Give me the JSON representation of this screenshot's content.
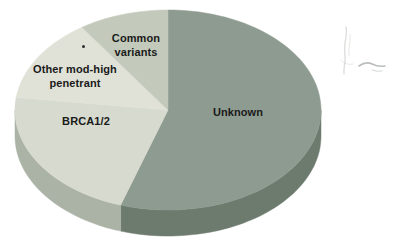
{
  "figure": {
    "background": "#ffffff",
    "label_color": "#1a1a1a"
  },
  "chart_data": {
    "type": "pie",
    "style": "3d-extruded",
    "title": "",
    "legend": "none",
    "labels_on_slices": true,
    "start_angle": "12 o'clock, clockwise",
    "slices": [
      {
        "label": "Unknown",
        "value_pct": 55,
        "color": "#8e9b90",
        "side_color": "#6d7b6f"
      },
      {
        "label": "BRCA1/2",
        "value_pct": 22,
        "color": "#d6dacf",
        "side_color": "#abb3a7"
      },
      {
        "label": "Other mod-high penetrant",
        "value_pct": 13.5,
        "color": "#e0e2d8",
        "side_color": "#b4bcb0"
      },
      {
        "label": "Common variants",
        "value_pct": 9.5,
        "color": "#c3cabb",
        "side_color": "#9ba89c"
      }
    ]
  },
  "artifacts": {
    "dot_marker": "•",
    "smudge": "faint pencil smudge"
  }
}
